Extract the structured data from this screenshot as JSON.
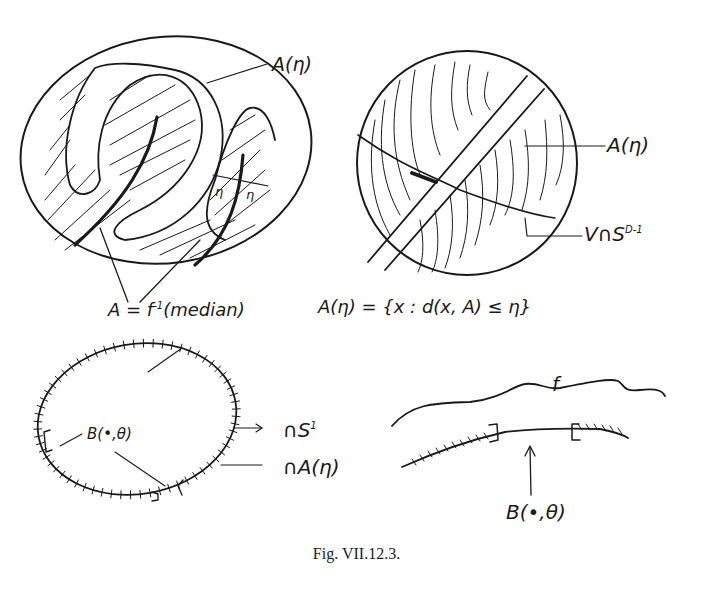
{
  "figure": {
    "caption": "Fig. VII.12.3.",
    "panels": {
      "top_left": {
        "label_A_eta": "A(η)",
        "label_eta_1": "η",
        "label_eta_2": "η",
        "formula_prefix": "A = f",
        "formula_sup": "-1",
        "formula_suffix": "(median)"
      },
      "top_right": {
        "label_A_eta": "A(η)",
        "label_V_prefix": "V∩S",
        "label_V_sup": "D-1",
        "formula": "A(η) = {x : d(x, A) ≤ η}"
      },
      "bottom_left": {
        "label_B": "B(•,θ)",
        "label_S_prefix": "∩S",
        "label_S_sup": "1",
        "label_A_eta": "∩A(η)"
      },
      "bottom_right": {
        "label_f": "f",
        "label_B": "B(•,θ)"
      }
    }
  }
}
